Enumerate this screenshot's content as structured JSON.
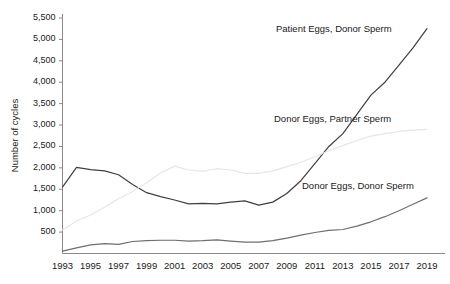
{
  "chart_data": {
    "type": "line",
    "title": "",
    "xlabel": "",
    "ylabel": "Number of cycles",
    "xlim": [
      1993,
      2019
    ],
    "ylim": [
      0,
      5500
    ],
    "grid": false,
    "legend_position": "inline-annotations",
    "ytick_labels": [
      "500",
      "1,000",
      "1,500",
      "2,000",
      "2,500",
      "3,000",
      "3,500",
      "4,000",
      "4,500",
      "5,000",
      "5,500"
    ],
    "ytick_values": [
      500,
      1000,
      1500,
      2000,
      2500,
      3000,
      3500,
      4000,
      4500,
      5000,
      5500
    ],
    "xtick_labels": [
      "1993",
      "1995",
      "1997",
      "1999",
      "2001",
      "2003",
      "2005",
      "2007",
      "2009",
      "2011",
      "2013",
      "2015",
      "2017",
      "2019"
    ],
    "xtick_values": [
      1993,
      1995,
      1997,
      1999,
      2001,
      2003,
      2005,
      2007,
      2009,
      2011,
      2013,
      2015,
      2017,
      2019
    ],
    "x": [
      1993,
      1994,
      1995,
      1996,
      1997,
      1998,
      1999,
      2000,
      2001,
      2002,
      2003,
      2004,
      2005,
      2006,
      2007,
      2008,
      2009,
      2010,
      2011,
      2012,
      2013,
      2014,
      2015,
      2016,
      2017,
      2018,
      2019
    ],
    "series": [
      {
        "name": "Patient Eggs, Donor Sperm",
        "color": "#3f3f3f",
        "width": 1.2,
        "values": [
          1550,
          2010,
          1960,
          1930,
          1840,
          1610,
          1420,
          1330,
          1250,
          1160,
          1170,
          1160,
          1200,
          1230,
          1130,
          1200,
          1400,
          1700,
          2100,
          2500,
          2800,
          3250,
          3700,
          4000,
          4400,
          4800,
          5250
        ]
      },
      {
        "name": "Donor Eggs, Partner Sperm",
        "color": "#e6e6e6",
        "width": 1.2,
        "values": [
          550,
          760,
          900,
          1080,
          1280,
          1450,
          1650,
          1880,
          2040,
          1950,
          1920,
          1980,
          1950,
          1870,
          1870,
          1930,
          2030,
          2130,
          2260,
          2400,
          2520,
          2640,
          2740,
          2800,
          2850,
          2880,
          2900
        ]
      },
      {
        "name": "Donor Eggs, Donor Sperm",
        "color": "#6e6e6e",
        "width": 1.2,
        "values": [
          55,
          130,
          200,
          230,
          215,
          280,
          300,
          310,
          310,
          290,
          300,
          320,
          290,
          265,
          265,
          300,
          360,
          430,
          490,
          540,
          560,
          640,
          740,
          860,
          1000,
          1150,
          1300
        ]
      }
    ],
    "annotations": [
      {
        "text": "Patient Eggs, Donor Sperm",
        "x_px": 276,
        "y_px": 23
      },
      {
        "text": "Donor Eggs, Partner Sperm",
        "x_px": 274,
        "y_px": 113
      },
      {
        "text": "Donor Eggs, Donor Sperm",
        "x_px": 302,
        "y_px": 180
      }
    ]
  },
  "axis": {
    "y_title": "Number of cycles"
  }
}
